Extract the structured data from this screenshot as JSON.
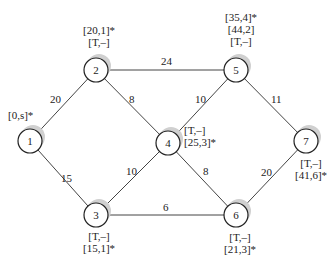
{
  "nodes": [
    {
      "id": "1",
      "x": 30,
      "y": 141,
      "labels": [
        "[0,s]*"
      ]
    },
    {
      "id": "2",
      "x": 96,
      "y": 70,
      "labels": [
        "[20,1]*",
        "[T,–]"
      ]
    },
    {
      "id": "3",
      "x": 96,
      "y": 215,
      "labels": [
        "[T,–]",
        "[15,1]*"
      ]
    },
    {
      "id": "4",
      "x": 168,
      "y": 143,
      "labels": [
        "[T,–]",
        "[25,3]*"
      ]
    },
    {
      "id": "5",
      "x": 236,
      "y": 70,
      "labels": [
        "[35,4]*",
        "[44,2]",
        "[T,–]"
      ]
    },
    {
      "id": "6",
      "x": 236,
      "y": 215,
      "labels": [
        "[T,–]",
        "[21,3]*"
      ]
    },
    {
      "id": "7",
      "x": 306,
      "y": 141,
      "labels": [
        "[T,–]",
        "[41,6]*"
      ]
    }
  ],
  "edges": [
    {
      "from": "1",
      "to": "2",
      "weight": "20"
    },
    {
      "from": "1",
      "to": "3",
      "weight": "15"
    },
    {
      "from": "2",
      "to": "4",
      "weight": "8"
    },
    {
      "from": "2",
      "to": "5",
      "weight": "24"
    },
    {
      "from": "3",
      "to": "4",
      "weight": "10"
    },
    {
      "from": "3",
      "to": "6",
      "weight": "6"
    },
    {
      "from": "4",
      "to": "5",
      "weight": "10"
    },
    {
      "from": "4",
      "to": "6",
      "weight": "8"
    },
    {
      "from": "5",
      "to": "7",
      "weight": "11"
    },
    {
      "from": "6",
      "to": "7",
      "weight": "20"
    }
  ],
  "colors": {
    "line": "#444444",
    "node_fill": "#ffffff",
    "shadow": "#cfcfcf"
  }
}
